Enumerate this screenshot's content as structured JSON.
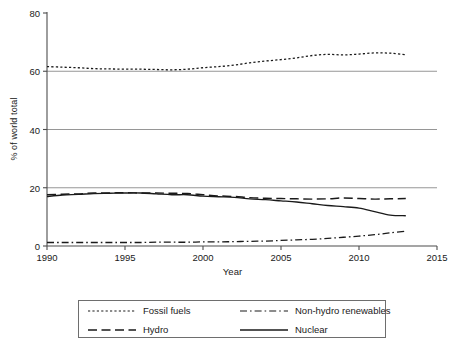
{
  "chart_data": {
    "type": "line",
    "title": "",
    "xlabel": "Year",
    "ylabel": "% of world total",
    "xlim": [
      1990,
      2015
    ],
    "ylim": [
      0,
      80
    ],
    "xticks": [
      1990,
      1995,
      2000,
      2005,
      2010,
      2015
    ],
    "yticks": [
      0,
      20,
      40,
      60,
      80
    ],
    "grid": "horizontal gridlines at 20, 40, 60",
    "legend_position": "below plot, boxed, two columns",
    "x": [
      1990,
      1991,
      1992,
      1993,
      1994,
      1995,
      1996,
      1997,
      1998,
      1999,
      2000,
      2001,
      2002,
      2003,
      2004,
      2005,
      2006,
      2007,
      2008,
      2009,
      2010,
      2011,
      2012,
      2013
    ],
    "series": [
      {
        "name": "Fossil fuels",
        "style": "dotted",
        "values": [
          61.6,
          61.4,
          61.2,
          60.9,
          60.8,
          60.7,
          60.7,
          60.6,
          60.5,
          60.7,
          61.2,
          61.6,
          62.1,
          62.9,
          63.5,
          64.0,
          64.6,
          65.4,
          65.8,
          65.6,
          65.9,
          66.3,
          66.2,
          65.7
        ]
      },
      {
        "name": "Non-hydro renewables",
        "style": "dash-dot",
        "values": [
          1.2,
          1.2,
          1.2,
          1.2,
          1.2,
          1.2,
          1.2,
          1.3,
          1.3,
          1.3,
          1.4,
          1.4,
          1.5,
          1.6,
          1.7,
          1.9,
          2.1,
          2.3,
          2.6,
          3.0,
          3.4,
          3.9,
          4.5,
          5.1
        ]
      },
      {
        "name": "Hydro",
        "style": "long-dash",
        "values": [
          17.6,
          17.8,
          17.9,
          18.2,
          18.2,
          18.3,
          18.2,
          18.2,
          18.1,
          18.0,
          17.6,
          17.2,
          17.0,
          16.6,
          16.4,
          16.3,
          16.2,
          16.1,
          16.2,
          16.5,
          16.3,
          16.1,
          16.2,
          16.3
        ]
      },
      {
        "name": "Nuclear",
        "style": "solid",
        "values": [
          17.0,
          17.5,
          17.7,
          18.0,
          18.1,
          18.2,
          18.2,
          17.9,
          17.6,
          17.6,
          17.1,
          16.9,
          16.7,
          16.2,
          15.9,
          15.5,
          15.1,
          14.5,
          13.9,
          13.5,
          13.0,
          11.8,
          10.6,
          10.4
        ]
      }
    ]
  },
  "axes": {
    "xlabel": "Year",
    "ylabel": "% of world total",
    "xticks": [
      "1990",
      "1995",
      "2000",
      "2005",
      "2010",
      "2015"
    ],
    "yticks": [
      "0",
      "20",
      "40",
      "60",
      "80"
    ]
  },
  "legend": {
    "entries": [
      {
        "label": "Fossil fuels",
        "style": "dotted"
      },
      {
        "label": "Non-hydro renewables",
        "style": "dash-dot"
      },
      {
        "label": "Hydro",
        "style": "long-dash"
      },
      {
        "label": "Nuclear",
        "style": "solid"
      }
    ]
  },
  "colors": {
    "line": "#1a1a1a",
    "grid": "#8a8a8a",
    "axis": "#4d4d4d",
    "legend_border": "#6e6e6e",
    "background": "#ffffff"
  }
}
